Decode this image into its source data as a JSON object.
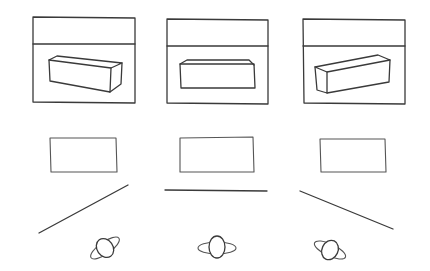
{
  "diagram": {
    "ink_color": "#3a3a3a",
    "background": "#ffffff",
    "columns": [
      {
        "id": "left",
        "frame": {
          "x": 33,
          "y": 17,
          "w": 102,
          "h": 86,
          "divider_y": 44
        },
        "box": "angled box rotated, viewed from left-front",
        "object_rect": {
          "x": 50,
          "y": 138,
          "w": 67,
          "h": 34
        },
        "plane_line": {
          "x1": 39,
          "y1": 233,
          "x2": 128,
          "y2": 185
        },
        "observer": {
          "cx": 105,
          "cy": 248,
          "angle": -35
        }
      },
      {
        "id": "center",
        "frame": {
          "x": 167,
          "y": 19,
          "w": 101,
          "h": 85,
          "divider_y": 46
        },
        "box": "box viewed frontally",
        "object_rect": {
          "x": 180,
          "y": 137,
          "w": 74,
          "h": 35
        },
        "plane_line": {
          "x1": 165,
          "y1": 190,
          "x2": 267,
          "y2": 191
        },
        "observer": {
          "cx": 217,
          "cy": 248,
          "angle": 0
        }
      },
      {
        "id": "right",
        "frame": {
          "x": 303,
          "y": 19,
          "w": 102,
          "h": 85,
          "divider_y": 46
        },
        "box": "angled box rotated, viewed from right-front",
        "object_rect": {
          "x": 320,
          "y": 139,
          "w": 66,
          "h": 33
        },
        "plane_line": {
          "x1": 300,
          "y1": 191,
          "x2": 393,
          "y2": 229
        },
        "observer": {
          "cx": 330,
          "cy": 250,
          "angle": 25
        }
      }
    ]
  }
}
